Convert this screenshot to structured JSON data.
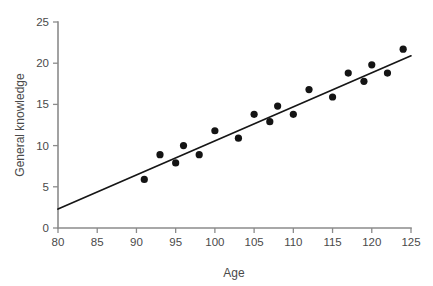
{
  "chart_data": {
    "type": "scatter",
    "title": "",
    "xlabel": "Age",
    "ylabel": "General knowledge",
    "xlim": [
      80,
      125
    ],
    "ylim": [
      0,
      25
    ],
    "xticks": [
      80,
      85,
      90,
      95,
      100,
      105,
      110,
      115,
      120,
      125
    ],
    "yticks": [
      0,
      5,
      10,
      15,
      20,
      25
    ],
    "grid": false,
    "legend": null,
    "point_color": "#141414",
    "line_color": "#161616",
    "axis_color": "#8b8b8b",
    "points": [
      {
        "x": 91,
        "y": 5.9
      },
      {
        "x": 93,
        "y": 8.9
      },
      {
        "x": 95,
        "y": 7.9
      },
      {
        "x": 96,
        "y": 10.0
      },
      {
        "x": 98,
        "y": 8.9
      },
      {
        "x": 100,
        "y": 11.8
      },
      {
        "x": 103,
        "y": 10.9
      },
      {
        "x": 105,
        "y": 13.8
      },
      {
        "x": 107,
        "y": 12.9
      },
      {
        "x": 108,
        "y": 14.8
      },
      {
        "x": 110,
        "y": 13.8
      },
      {
        "x": 112,
        "y": 16.8
      },
      {
        "x": 115,
        "y": 15.9
      },
      {
        "x": 117,
        "y": 18.8
      },
      {
        "x": 119,
        "y": 17.8
      },
      {
        "x": 120,
        "y": 19.8
      },
      {
        "x": 122,
        "y": 18.8
      },
      {
        "x": 124,
        "y": 21.7
      }
    ],
    "fit_line": {
      "x_start": 80,
      "y_start": 2.3,
      "x_end": 125,
      "y_end": 20.9,
      "slope": 0.413,
      "intercept": -30.7
    }
  },
  "labels": {
    "x_axis_title": "Age",
    "y_axis_title": "General knowledge",
    "x_tick_texts": [
      "80",
      "85",
      "90",
      "95",
      "100",
      "105",
      "110",
      "115",
      "120",
      "125"
    ],
    "y_tick_texts": [
      "0",
      "5",
      "10",
      "15",
      "20",
      "25"
    ]
  }
}
